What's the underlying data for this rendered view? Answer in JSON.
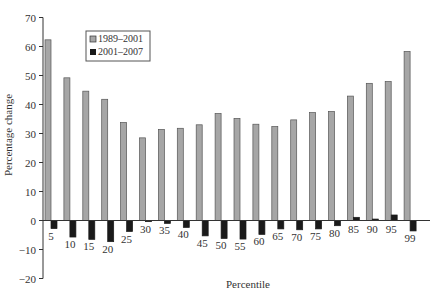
{
  "chart_data": {
    "type": "bar",
    "title": "",
    "xlabel": "Percentile",
    "ylabel": "Percentage change",
    "ylim": [
      -20,
      70
    ],
    "yticks": [
      -20,
      -10,
      0,
      10,
      20,
      30,
      40,
      50,
      60,
      70
    ],
    "grid": false,
    "legend_position": "top-left",
    "categories": [
      "5",
      "10",
      "15",
      "20",
      "25",
      "30",
      "35",
      "40",
      "45",
      "50",
      "55",
      "60",
      "65",
      "70",
      "75",
      "80",
      "85",
      "90",
      "95",
      "99"
    ],
    "series": [
      {
        "name": "1989–2001",
        "color": "#a6a6a6",
        "values": [
          62.3,
          49.2,
          44.6,
          41.8,
          33.8,
          28.5,
          31.4,
          31.8,
          33.0,
          36.9,
          35.2,
          33.2,
          32.4,
          34.7,
          37.2,
          37.6,
          42.9,
          47.3,
          47.9,
          58.3
        ]
      },
      {
        "name": "2001–2007",
        "color": "#1a1a1a",
        "values": [
          -2.8,
          -5.7,
          -6.5,
          -7.3,
          -3.8,
          -0.4,
          -1.0,
          -2.4,
          -5.3,
          -6.2,
          -6.4,
          -4.8,
          -2.9,
          -3.2,
          -2.9,
          -1.8,
          1.1,
          0.5,
          1.9,
          -3.6
        ]
      }
    ]
  }
}
